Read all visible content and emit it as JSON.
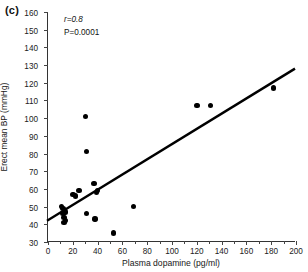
{
  "panel": {
    "label": "(c)"
  },
  "chart_data": {
    "type": "scatter",
    "title": "",
    "xlabel": "Plasma dopamine (pg/ml)",
    "ylabel": "Erect mean BP (mmHg)",
    "xlim": [
      0,
      200
    ],
    "ylim": [
      30,
      160
    ],
    "xticks": [
      0,
      20,
      40,
      60,
      80,
      100,
      120,
      140,
      160,
      180,
      200
    ],
    "yticks": [
      30,
      40,
      50,
      60,
      70,
      80,
      90,
      100,
      110,
      120,
      130,
      140,
      150,
      160
    ],
    "grid": false,
    "legend": null,
    "annotations": [
      {
        "name": "correlation",
        "text": "r=0.8"
      },
      {
        "name": "p-value",
        "text": "P=0.0001"
      }
    ],
    "marker": {
      "shape": "circle",
      "color": "#000000",
      "size": 5
    },
    "points": [
      {
        "x": 11,
        "y": 50
      },
      {
        "x": 12,
        "y": 49
      },
      {
        "x": 12,
        "y": 46
      },
      {
        "x": 13,
        "y": 44
      },
      {
        "x": 13,
        "y": 41
      },
      {
        "x": 14,
        "y": 42
      },
      {
        "x": 14,
        "y": 47
      },
      {
        "x": 20,
        "y": 57
      },
      {
        "x": 22,
        "y": 56
      },
      {
        "x": 25,
        "y": 59
      },
      {
        "x": 30,
        "y": 101
      },
      {
        "x": 31,
        "y": 81
      },
      {
        "x": 31,
        "y": 46
      },
      {
        "x": 37,
        "y": 63
      },
      {
        "x": 38,
        "y": 43
      },
      {
        "x": 39,
        "y": 58
      },
      {
        "x": 40,
        "y": 59
      },
      {
        "x": 53,
        "y": 35
      },
      {
        "x": 69,
        "y": 50
      },
      {
        "x": 120,
        "y": 107
      },
      {
        "x": 131,
        "y": 107
      },
      {
        "x": 182,
        "y": 117
      }
    ],
    "trendline": {
      "name": "regression-line",
      "x_start": 0,
      "y_start": 42,
      "x_end": 200,
      "y_end": 128,
      "color": "#000000",
      "width": 2.4
    }
  }
}
